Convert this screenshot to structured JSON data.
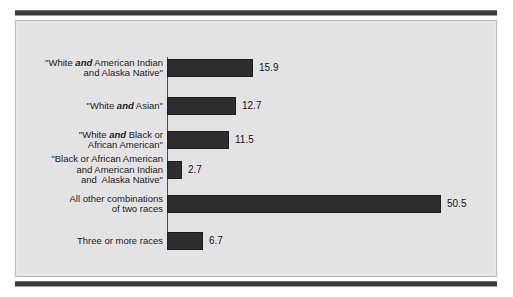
{
  "figure": {
    "background_color": "#ffffff",
    "panel_color": "#e3e3e3",
    "bar_color": "#2e2e2e",
    "rule_color": "#3a3a3a"
  },
  "chart_data": {
    "type": "bar",
    "orientation": "horizontal",
    "title": "",
    "subtitle": "",
    "xlabel": "",
    "ylabel": "",
    "grid": false,
    "legend": false,
    "xlim": [
      0,
      50.5
    ],
    "categories": [
      "\"White and American Indian\nand Alaska Native\"",
      "\"White and Asian\"",
      "\"White and Black or\nAfrican American\"",
      "\"Black or African American\nand American Indian\nand  Alaska Native\"",
      "All other combinations\nof two races",
      "Three or more races"
    ],
    "values": [
      15.9,
      12.7,
      11.5,
      2.7,
      50.5,
      6.7
    ],
    "value_labels": [
      "15.9",
      "12.7",
      "11.5",
      "2.7",
      "50.5",
      "6.7"
    ],
    "rows": [
      {
        "label_lines": [
          [
            {
              "t": "\"White ",
              "b": false
            },
            {
              "t": "and",
              "b": true
            },
            {
              "t": " American Indian",
              "b": false
            }
          ],
          [
            {
              "t": "and Alaska Native\"",
              "b": false
            }
          ]
        ],
        "value": 15.9,
        "value_label": "15.9"
      },
      {
        "label_lines": [
          [
            {
              "t": "\"White ",
              "b": false
            },
            {
              "t": "and",
              "b": true
            },
            {
              "t": " Asian\"",
              "b": false
            }
          ]
        ],
        "value": 12.7,
        "value_label": "12.7"
      },
      {
        "label_lines": [
          [
            {
              "t": "\"White ",
              "b": false
            },
            {
              "t": "and",
              "b": true
            },
            {
              "t": " Black or",
              "b": false
            }
          ],
          [
            {
              "t": "African American\"",
              "b": false
            }
          ]
        ],
        "value": 11.5,
        "value_label": "11.5"
      },
      {
        "label_lines": [
          [
            {
              "t": "\"Black or African American",
              "b": false
            }
          ],
          [
            {
              "t": "and American Indian",
              "b": false
            }
          ],
          [
            {
              "t": "and  Alaska Native\"",
              "b": false
            }
          ]
        ],
        "value": 2.7,
        "value_label": "2.7"
      },
      {
        "label_lines": [
          [
            {
              "t": "All other combinations",
              "b": false
            }
          ],
          [
            {
              "t": "of two races",
              "b": false
            }
          ]
        ],
        "value": 50.5,
        "value_label": "50.5"
      },
      {
        "label_lines": [
          [
            {
              "t": "Three or more races",
              "b": false
            }
          ]
        ],
        "value": 6.7,
        "value_label": "6.7"
      }
    ],
    "layout": {
      "axis_left_px": 151,
      "axis_top_px": 36,
      "axis_height_px": 193,
      "px_per_unit": 5.42,
      "bar_height_px": 18,
      "row_tops_px": [
        38,
        76,
        110,
        140,
        174,
        211
      ]
    }
  }
}
